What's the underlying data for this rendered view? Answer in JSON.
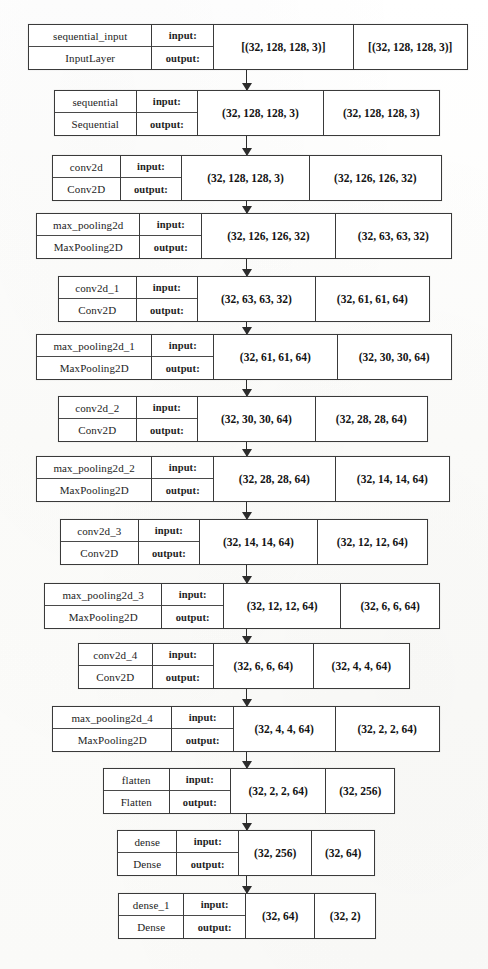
{
  "diagram": {
    "type": "layer-graph",
    "orientation": "top-to-bottom",
    "io_labels": {
      "input": "input:",
      "output": "output:"
    },
    "colors": {
      "border": "#3a3a3a",
      "text": "#1d1d1d",
      "arrow": "#2c2c2c",
      "background": "#ffffff"
    },
    "nodes": [
      {
        "id": "sequential_input",
        "name": "sequential_input",
        "class_name": "InputLayer",
        "input_shape": "[(32, 128, 128, 3)]",
        "output_shape": "[(32, 128, 128, 3)]",
        "box": {
          "x": 28,
          "y": 24,
          "w": 440,
          "h": 46
        },
        "cols": {
          "name": 124,
          "io": 62,
          "in": 140,
          "out": 114
        }
      },
      {
        "id": "sequential",
        "name": "sequential",
        "class_name": "Sequential",
        "input_shape": "(32, 128, 128, 3)",
        "output_shape": "(32, 128, 128, 3)",
        "box": {
          "x": 54,
          "y": 90,
          "w": 386,
          "h": 46
        },
        "cols": {
          "name": 82,
          "io": 62,
          "in": 126,
          "out": 116
        }
      },
      {
        "id": "conv2d",
        "name": "conv2d",
        "class_name": "Conv2D",
        "input_shape": "(32, 128, 128, 3)",
        "output_shape": "(32, 126, 126, 32)",
        "box": {
          "x": 52,
          "y": 155,
          "w": 390,
          "h": 46
        },
        "cols": {
          "name": 68,
          "io": 62,
          "in": 128,
          "out": 132
        }
      },
      {
        "id": "max_pooling2d",
        "name": "max_pooling2d",
        "class_name": "MaxPooling2D",
        "input_shape": "(32, 126, 126, 32)",
        "output_shape": "(32, 63, 63, 32)",
        "box": {
          "x": 36,
          "y": 213,
          "w": 416,
          "h": 46
        },
        "cols": {
          "name": 104,
          "io": 62,
          "in": 134,
          "out": 116
        }
      },
      {
        "id": "conv2d_1",
        "name": "conv2d_1",
        "class_name": "Conv2D",
        "input_shape": "(32, 63, 63, 32)",
        "output_shape": "(32, 61, 61, 64)",
        "box": {
          "x": 58,
          "y": 276,
          "w": 372,
          "h": 46
        },
        "cols": {
          "name": 78,
          "io": 62,
          "in": 118,
          "out": 114
        }
      },
      {
        "id": "max_pooling2d_1",
        "name": "max_pooling2d_1",
        "class_name": "MaxPooling2D",
        "input_shape": "(32, 61, 61, 64)",
        "output_shape": "(32, 30, 30, 64)",
        "box": {
          "x": 36,
          "y": 334,
          "w": 416,
          "h": 46
        },
        "cols": {
          "name": 116,
          "io": 62,
          "in": 124,
          "out": 114
        }
      },
      {
        "id": "conv2d_2",
        "name": "conv2d_2",
        "class_name": "Conv2D",
        "input_shape": "(32, 30, 30, 64)",
        "output_shape": "(32, 28, 28, 64)",
        "box": {
          "x": 58,
          "y": 396,
          "w": 370,
          "h": 46
        },
        "cols": {
          "name": 78,
          "io": 62,
          "in": 118,
          "out": 112
        }
      },
      {
        "id": "max_pooling2d_2",
        "name": "max_pooling2d_2",
        "class_name": "MaxPooling2D",
        "input_shape": "(32, 28, 28, 64)",
        "output_shape": "(32, 14, 14, 64)",
        "box": {
          "x": 36,
          "y": 456,
          "w": 414,
          "h": 46
        },
        "cols": {
          "name": 116,
          "io": 62,
          "in": 122,
          "out": 114
        }
      },
      {
        "id": "conv2d_3",
        "name": "conv2d_3",
        "class_name": "Conv2D",
        "input_shape": "(32, 14, 14, 64)",
        "output_shape": "(32, 12, 12, 64)",
        "box": {
          "x": 60,
          "y": 519,
          "w": 368,
          "h": 46
        },
        "cols": {
          "name": 78,
          "io": 62,
          "in": 118,
          "out": 110
        }
      },
      {
        "id": "max_pooling2d_3",
        "name": "max_pooling2d_3",
        "class_name": "MaxPooling2D",
        "input_shape": "(32, 12, 12, 64)",
        "output_shape": "(32, 6, 6, 64)",
        "box": {
          "x": 44,
          "y": 583,
          "w": 396,
          "h": 46
        },
        "cols": {
          "name": 118,
          "io": 62,
          "in": 118,
          "out": 98
        }
      },
      {
        "id": "conv2d_4",
        "name": "conv2d_4",
        "class_name": "Conv2D",
        "input_shape": "(32, 6, 6, 64)",
        "output_shape": "(32, 4, 4, 64)",
        "box": {
          "x": 78,
          "y": 643,
          "w": 332,
          "h": 46
        },
        "cols": {
          "name": 74,
          "io": 62,
          "in": 100,
          "out": 96
        }
      },
      {
        "id": "max_pooling2d_4",
        "name": "max_pooling2d_4",
        "class_name": "MaxPooling2D",
        "input_shape": "(32, 4, 4, 64)",
        "output_shape": "(32, 2, 2, 64)",
        "box": {
          "x": 52,
          "y": 706,
          "w": 388,
          "h": 46
        },
        "cols": {
          "name": 120,
          "io": 62,
          "in": 102,
          "out": 104
        }
      },
      {
        "id": "flatten",
        "name": "flatten",
        "class_name": "Flatten",
        "input_shape": "(32, 2, 2, 64)",
        "output_shape": "(32, 256)",
        "box": {
          "x": 103,
          "y": 768,
          "w": 292,
          "h": 46
        },
        "cols": {
          "name": 66,
          "io": 62,
          "in": 96,
          "out": 68
        }
      },
      {
        "id": "dense",
        "name": "dense",
        "class_name": "Dense",
        "input_shape": "(32, 256)",
        "output_shape": "(32, 64)",
        "box": {
          "x": 117,
          "y": 830,
          "w": 258,
          "h": 46
        },
        "cols": {
          "name": 60,
          "io": 62,
          "in": 74,
          "out": 62
        }
      },
      {
        "id": "dense_1",
        "name": "dense_1",
        "class_name": "Dense",
        "input_shape": "(32, 64)",
        "output_shape": "(32, 2)",
        "box": {
          "x": 118,
          "y": 893,
          "w": 258,
          "h": 46
        },
        "cols": {
          "name": 66,
          "io": 62,
          "in": 70,
          "out": 60
        }
      }
    ],
    "edges": [
      {
        "from": "sequential_input",
        "to": "sequential",
        "x": 246,
        "y": 70,
        "h": 20
      },
      {
        "from": "sequential",
        "to": "conv2d",
        "x": 246,
        "y": 136,
        "h": 19
      },
      {
        "from": "conv2d",
        "to": "max_pooling2d",
        "x": 246,
        "y": 201,
        "h": 12
      },
      {
        "from": "max_pooling2d",
        "to": "conv2d_1",
        "x": 246,
        "y": 259,
        "h": 17
      },
      {
        "from": "conv2d_1",
        "to": "max_pooling2d_1",
        "x": 246,
        "y": 322,
        "h": 12
      },
      {
        "from": "max_pooling2d_1",
        "to": "conv2d_2",
        "x": 246,
        "y": 380,
        "h": 16
      },
      {
        "from": "conv2d_2",
        "to": "max_pooling2d_2",
        "x": 246,
        "y": 442,
        "h": 14
      },
      {
        "from": "max_pooling2d_2",
        "to": "conv2d_3",
        "x": 246,
        "y": 502,
        "h": 17
      },
      {
        "from": "conv2d_3",
        "to": "max_pooling2d_3",
        "x": 246,
        "y": 565,
        "h": 18
      },
      {
        "from": "max_pooling2d_3",
        "to": "conv2d_4",
        "x": 246,
        "y": 629,
        "h": 14
      },
      {
        "from": "conv2d_4",
        "to": "max_pooling2d_4",
        "x": 246,
        "y": 689,
        "h": 17
      },
      {
        "from": "max_pooling2d_4",
        "to": "flatten",
        "x": 246,
        "y": 752,
        "h": 16
      },
      {
        "from": "flatten",
        "to": "dense",
        "x": 246,
        "y": 814,
        "h": 16
      },
      {
        "from": "dense",
        "to": "dense_1",
        "x": 246,
        "y": 876,
        "h": 17
      }
    ]
  }
}
